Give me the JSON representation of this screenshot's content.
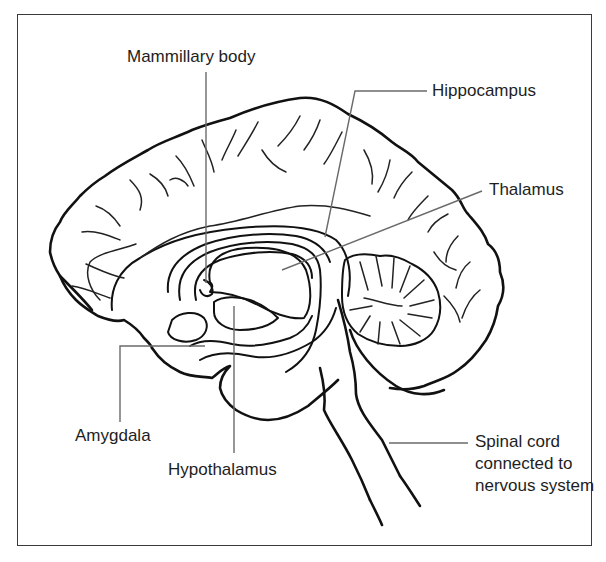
{
  "diagram": {
    "labels": {
      "mammillary_body": "Mammillary body",
      "hippocampus": "Hippocampus",
      "thalamus": "Thalamus",
      "amygdala": "Amygdala",
      "hypothalamus": "Hypothalamus",
      "spinal_cord": "Spinal cord connected to nervous system"
    },
    "colors": {
      "line": "#111111",
      "leader": "#6a6a6a",
      "frame": "#3a3a3a",
      "background": "#ffffff"
    }
  }
}
